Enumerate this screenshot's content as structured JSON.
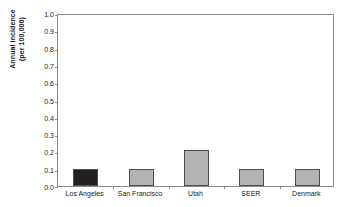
{
  "chart_data": {
    "type": "bar",
    "title": "",
    "xlabel": "",
    "ylabel": "Annual incidence (per 100,000)",
    "ylabel_lines": [
      "Annual incidence",
      "(per 100,000)"
    ],
    "categories": [
      "Los Angeles",
      "San Francisco",
      "Utah",
      "SEER",
      "Denmark"
    ],
    "values": [
      0.1,
      0.1,
      0.21,
      0.1,
      0.1
    ],
    "bar_colors": [
      "#231f20",
      "#b3b3b3",
      "#b3b3b3",
      "#b3b3b3",
      "#b3b3b3"
    ],
    "bar_border_color": "#4d4d4d",
    "ylim": [
      0.0,
      1.0
    ],
    "ytick_values": [
      0.0,
      0.1,
      0.2,
      0.3,
      0.4,
      0.5,
      0.6,
      0.7,
      0.8,
      0.9,
      1.0
    ],
    "ytick_labels": [
      "0.0",
      "0.1",
      "0.2",
      "0.3",
      "0.4",
      "0.5",
      "0.6",
      "0.7",
      "0.8",
      "0.9",
      "1.0"
    ],
    "grid": false,
    "legend": null,
    "frame_color": "#8c8c8c",
    "background": "#ffffff"
  }
}
